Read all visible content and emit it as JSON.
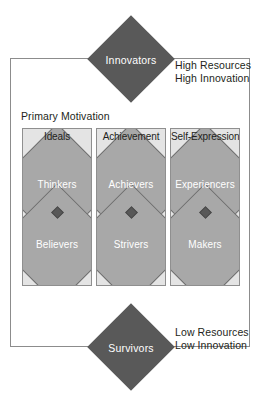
{
  "diagram": {
    "motivation_label": "Primary Motivation",
    "apex_top": "Innovators",
    "apex_bottom": "Survivors",
    "resources_high": {
      "line1": "High Resources",
      "line2": "High Innovation"
    },
    "resources_low": {
      "line1": "Low Resources",
      "line2": "Low Innovation"
    },
    "columns": [
      {
        "header": "Ideals",
        "upper": "Thinkers",
        "lower": "Believers"
      },
      {
        "header": "Achievement",
        "upper": "Achievers",
        "lower": "Strivers"
      },
      {
        "header": "Self-Expression",
        "upper": "Experiencers",
        "lower": "Makers"
      }
    ],
    "colors": {
      "apex_fill": "#595959",
      "cell_fill": "#a8a8a8",
      "cell_stroke": "#6d6d6d",
      "column_fill": "#e4e4e4",
      "column_stroke": "#8f8f8f",
      "frame_stroke": "#8c8c8c",
      "text_dark": "#231f20",
      "text_light": "#ffffff",
      "node_dot": "#585858",
      "background": "#ffffff"
    }
  }
}
